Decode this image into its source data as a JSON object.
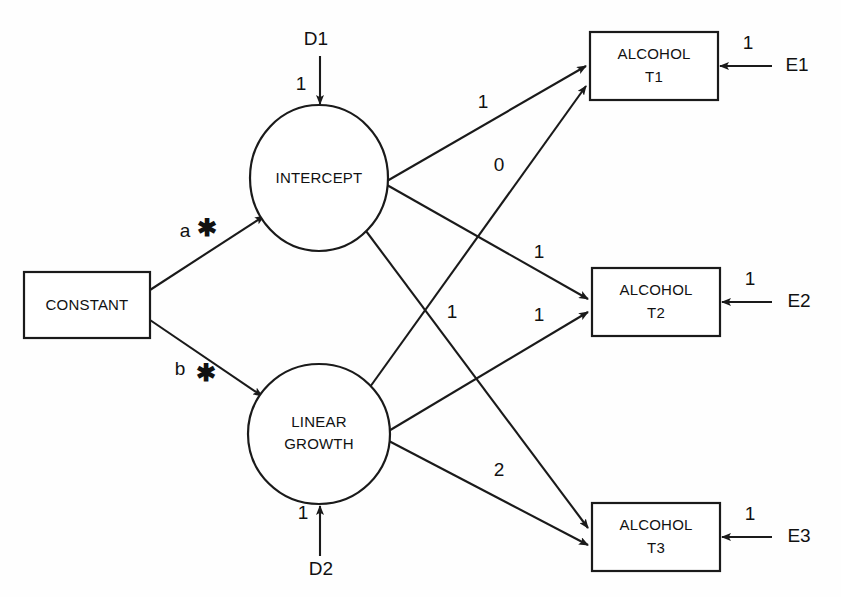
{
  "diagram": {
    "type": "structural-equation-model",
    "nodes": {
      "constant": {
        "label": "CONSTANT",
        "shape": "rectangle"
      },
      "intercept": {
        "label": "INTERCEPT",
        "shape": "ellipse"
      },
      "linear_growth_line1": {
        "label": "LINEAR",
        "shape": "ellipse"
      },
      "linear_growth_line2": {
        "label": "GROWTH"
      },
      "alcohol_t1_line1": {
        "label": "ALCOHOL",
        "shape": "rectangle"
      },
      "alcohol_t1_line2": {
        "label": "T1"
      },
      "alcohol_t2_line1": {
        "label": "ALCOHOL",
        "shape": "rectangle"
      },
      "alcohol_t2_line2": {
        "label": "T2"
      },
      "alcohol_t3_line1": {
        "label": "ALCOHOL",
        "shape": "rectangle"
      },
      "alcohol_t3_line2": {
        "label": "T3"
      },
      "d1": {
        "label": "D1",
        "shape": "none"
      },
      "d2": {
        "label": "D2",
        "shape": "none"
      },
      "e1": {
        "label": "E1",
        "shape": "none"
      },
      "e2": {
        "label": "E2",
        "shape": "none"
      },
      "e3": {
        "label": "E3",
        "shape": "none"
      }
    },
    "coefficients": {
      "constant_to_intercept": "a",
      "constant_to_intercept_marker": "✱",
      "constant_to_linear": "b",
      "constant_to_linear_marker": "✱",
      "d1_to_intercept": "1",
      "d2_to_linear": "1",
      "intercept_to_t1": "1",
      "intercept_to_t2": "1",
      "intercept_to_t3": "1",
      "linear_to_t1": "0",
      "linear_to_t2": "1",
      "linear_to_t3": "2",
      "e1_to_t1": "1",
      "e2_to_t2": "1",
      "e3_to_t3": "1"
    },
    "colors": {
      "stroke": "#1a1a1a",
      "fill": "#ffffff",
      "background": "#fefefe",
      "text": "#111111"
    }
  }
}
